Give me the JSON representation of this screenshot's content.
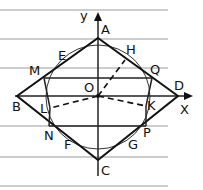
{
  "diagram": {
    "type": "geometry",
    "axes": {
      "x_label": "X",
      "y_label": "y",
      "origin_label": "O"
    },
    "points": {
      "A": "A",
      "B": "B",
      "C": "C",
      "D": "D",
      "E": "E",
      "F": "F",
      "G": "G",
      "H": "H",
      "K": "K",
      "L": "L",
      "M": "M",
      "N": "N",
      "P": "P",
      "Q": "Q",
      "O": "O"
    },
    "colors": {
      "ink": "#111111",
      "ruled_lines": "#9a9a9a",
      "background": "#ffffff"
    }
  }
}
